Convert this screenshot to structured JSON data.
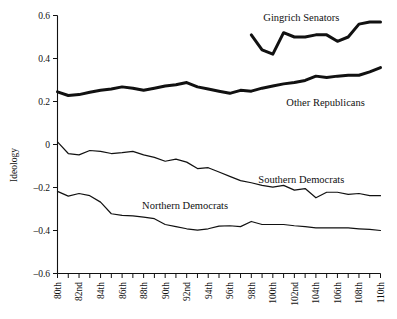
{
  "chart_data": {
    "type": "line",
    "title": "",
    "xlabel": "",
    "ylabel": "Ideology",
    "ylim": [
      -0.6,
      0.6
    ],
    "yticks": [
      0.6,
      0.4,
      0.2,
      0,
      -0.2,
      -0.4,
      -0.6
    ],
    "ytick_labels": [
      "0.6",
      "0.4",
      "0.2",
      "0",
      "–0.2",
      "–0.4",
      "–0.6"
    ],
    "grid": false,
    "legend_position": "inline-annotations",
    "categories": [
      "80th",
      "81st",
      "82nd",
      "83rd",
      "84th",
      "85th",
      "86th",
      "87th",
      "88th",
      "89th",
      "90th",
      "91st",
      "92nd",
      "93rd",
      "94th",
      "95th",
      "96th",
      "97th",
      "98th",
      "99th",
      "100th",
      "101st",
      "102nd",
      "103rd",
      "104th",
      "105th",
      "106th",
      "107th",
      "108th",
      "109th",
      "110th"
    ],
    "xtick_labels_shown": [
      "80th",
      "82nd",
      "84th",
      "86th",
      "88th",
      "90th",
      "92nd",
      "94th",
      "96th",
      "98th",
      "100th",
      "102nd",
      "104th",
      "106th",
      "108th",
      "110th"
    ],
    "series": [
      {
        "name": "Gingrich Senators",
        "style": "thick",
        "start_category": "98th",
        "x": [
          "98th",
          "99th",
          "100th",
          "101st",
          "102nd",
          "103rd",
          "104th",
          "105th",
          "106th",
          "107th",
          "108th",
          "109th",
          "110th"
        ],
        "values": [
          0.51,
          0.44,
          0.42,
          0.52,
          0.5,
          0.5,
          0.51,
          0.51,
          0.48,
          0.5,
          0.56,
          0.57,
          0.57
        ]
      },
      {
        "name": "Other Republicans",
        "style": "thick",
        "start_category": "80th",
        "x": [
          "80th",
          "81st",
          "82nd",
          "83rd",
          "84th",
          "85th",
          "86th",
          "87th",
          "88th",
          "89th",
          "90th",
          "91st",
          "92nd",
          "93rd",
          "94th",
          "95th",
          "96th",
          "97th",
          "98th",
          "99th",
          "100th",
          "101st",
          "102nd",
          "103rd",
          "104th",
          "105th",
          "106th",
          "107th",
          "108th",
          "109th",
          "110th"
        ],
        "values": [
          0.245,
          0.228,
          0.232,
          0.243,
          0.252,
          0.258,
          0.268,
          0.262,
          0.252,
          0.262,
          0.272,
          0.278,
          0.288,
          0.268,
          0.258,
          0.248,
          0.238,
          0.252,
          0.248,
          0.262,
          0.272,
          0.282,
          0.288,
          0.298,
          0.318,
          0.312,
          0.318,
          0.322,
          0.322,
          0.338,
          0.358
        ]
      },
      {
        "name": "Southern Democrats",
        "style": "thin",
        "start_category": "80th",
        "x": [
          "80th",
          "81st",
          "82nd",
          "83rd",
          "84th",
          "85th",
          "86th",
          "87th",
          "88th",
          "89th",
          "90th",
          "91st",
          "92nd",
          "93rd",
          "94th",
          "95th",
          "96th",
          "97th",
          "98th",
          "99th",
          "100th",
          "101st",
          "102nd",
          "103rd",
          "104th",
          "105th",
          "106th",
          "107th",
          "108th",
          "109th",
          "110th"
        ],
        "values": [
          0.012,
          -0.042,
          -0.048,
          -0.028,
          -0.032,
          -0.042,
          -0.038,
          -0.032,
          -0.048,
          -0.06,
          -0.078,
          -0.068,
          -0.082,
          -0.112,
          -0.108,
          -0.128,
          -0.148,
          -0.168,
          -0.178,
          -0.19,
          -0.198,
          -0.19,
          -0.212,
          -0.205,
          -0.248,
          -0.222,
          -0.222,
          -0.232,
          -0.228,
          -0.238,
          -0.238
        ]
      },
      {
        "name": "Northern Democrats",
        "style": "thin",
        "start_category": "80th",
        "x": [
          "80th",
          "81st",
          "82nd",
          "83rd",
          "84th",
          "85th",
          "86th",
          "87th",
          "88th",
          "89th",
          "90th",
          "91st",
          "92nd",
          "93rd",
          "94th",
          "95th",
          "96th",
          "97th",
          "98th",
          "99th",
          "100th",
          "101st",
          "102nd",
          "103rd",
          "104th",
          "105th",
          "106th",
          "107th",
          "108th",
          "109th",
          "110th"
        ],
        "values": [
          -0.218,
          -0.24,
          -0.228,
          -0.238,
          -0.268,
          -0.322,
          -0.33,
          -0.332,
          -0.338,
          -0.345,
          -0.372,
          -0.382,
          -0.392,
          -0.398,
          -0.392,
          -0.38,
          -0.378,
          -0.382,
          -0.358,
          -0.372,
          -0.372,
          -0.372,
          -0.378,
          -0.382,
          -0.388,
          -0.388,
          -0.388,
          -0.388,
          -0.392,
          -0.395,
          -0.4
        ]
      }
    ],
    "annotations": [
      {
        "text": "Gingrich Senators",
        "x": 0.755,
        "y": 0.573
      },
      {
        "text": "Other Republicans",
        "x": 0.83,
        "y": 0.178
      },
      {
        "text": "Southern Democrats",
        "x": 0.755,
        "y": -0.178
      },
      {
        "text": "Northern Democrats",
        "x": 0.395,
        "y": -0.298
      }
    ],
    "colors": {
      "line": "#111111",
      "axis": "#111111",
      "background": "#ffffff"
    }
  }
}
